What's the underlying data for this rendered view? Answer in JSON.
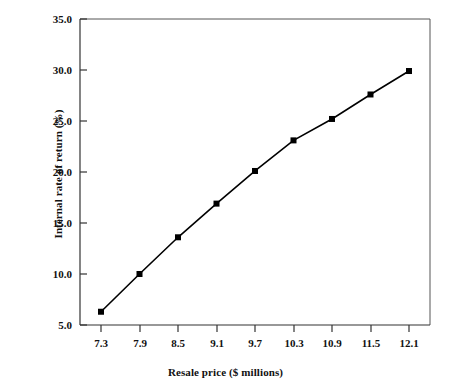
{
  "chart_data": {
    "type": "line",
    "title": "",
    "xlabel": "Resale price ($ millions)",
    "ylabel": "Internal rate of return (%)",
    "x": [
      7.3,
      7.9,
      8.5,
      9.1,
      9.7,
      10.3,
      10.9,
      11.5,
      12.1
    ],
    "values": [
      6.3,
      10.0,
      13.6,
      16.9,
      20.1,
      23.1,
      25.2,
      27.6,
      29.9
    ],
    "series": [
      {
        "name": "Internal rate of return",
        "values": [
          6.3,
          10.0,
          13.6,
          16.9,
          20.1,
          23.1,
          25.2,
          27.6,
          29.9
        ]
      }
    ],
    "xtick_labels": [
      "7.3",
      "7.9",
      "8.5",
      "9.1",
      "9.7",
      "10.3",
      "10.9",
      "11.5",
      "12.1"
    ],
    "ytick_labels": [
      "5.0",
      "10.0",
      "15.0",
      "20.0",
      "25.0",
      "30.0",
      "35.0"
    ],
    "ytick_values": [
      5.0,
      10.0,
      15.0,
      20.0,
      25.0,
      30.0,
      35.0
    ],
    "xlim": [
      7.0,
      12.4
    ],
    "ylim": [
      5.0,
      35.0
    ],
    "grid": false,
    "legend": "none",
    "marker": "filled-square",
    "line_color": "#000000",
    "marker_color": "#000000",
    "axis_color": "#000000",
    "background_color": "#ffffff"
  },
  "axes": {
    "y_title": "Internal rate of return (%)",
    "x_title": "Resale price ($ millions)",
    "y_labels": [
      "35.0",
      "30.0",
      "25.0",
      "20.0",
      "15.0",
      "10.0",
      "5.0"
    ],
    "x_labels": [
      "7.3",
      "7.9",
      "8.5",
      "9.1",
      "9.7",
      "10.3",
      "10.9",
      "11.5",
      "12.1"
    ]
  }
}
